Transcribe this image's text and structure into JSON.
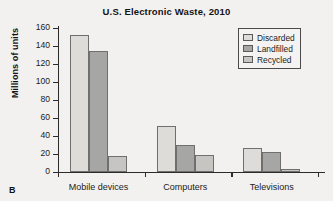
{
  "panel": {
    "letter": "B"
  },
  "chart_data": {
    "type": "bar",
    "title": "U.S. Electronic Waste, 2010",
    "xlabel": "",
    "ylabel": "Millions of units",
    "ylim": [
      0,
      160
    ],
    "ytick_step": 20,
    "yticks": [
      160,
      140,
      120,
      100,
      80,
      60,
      40,
      20,
      0
    ],
    "grid": false,
    "legend_position": "top-right",
    "categories": [
      "Mobile devices",
      "Computers",
      "Televisions"
    ],
    "series": [
      {
        "name": "Discarded",
        "color": "#dedcd9",
        "values": [
          152,
          51,
          27
        ]
      },
      {
        "name": "Landfilled",
        "color": "#a6a6a4",
        "values": [
          134,
          30,
          22
        ]
      },
      {
        "name": "Recycled",
        "color": "#c6c5c2",
        "values": [
          18,
          19,
          3
        ]
      }
    ]
  },
  "legend": {
    "entries": [
      {
        "label": "Discarded"
      },
      {
        "label": "Landfilled"
      },
      {
        "label": "Recycled"
      }
    ]
  }
}
